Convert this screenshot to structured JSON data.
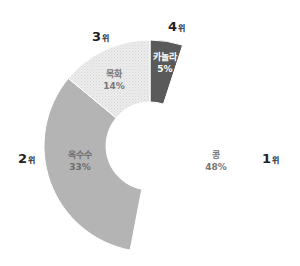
{
  "chart_data": {
    "type": "pie",
    "variant": "half-donut",
    "title": "",
    "center": [
      150,
      146
    ],
    "outer_radius": 106,
    "inner_radius": 44,
    "start_angle_deg": 0,
    "direction": "clockwise",
    "slices": [
      {
        "label": "카놀라",
        "value": 5,
        "display": "5%",
        "rank": "4",
        "color": "#5a5a5a",
        "text_color": "#ffffff",
        "label_pos": [
          165,
          63
        ],
        "rank_pos": [
          168,
          20
        ]
      },
      {
        "label": "콩",
        "value": 48,
        "display": "48%",
        "rank": "1",
        "color": "#ffffff",
        "text_color": "#777777",
        "label_pos": [
          216,
          161
        ],
        "rank_pos": [
          262,
          152
        ]
      },
      {
        "label": "옥수수",
        "value": 33,
        "display": "33%",
        "rank": "2",
        "color": "#b4b4b4",
        "text_color": "#6e6e6e",
        "label_pos": [
          80,
          161
        ],
        "rank_pos": [
          18,
          152
        ]
      },
      {
        "label": "목화",
        "value": 14,
        "display": "14%",
        "rank": "3",
        "color": "#e9e9e9",
        "pattern": "dots",
        "text_color": "#777777",
        "label_pos": [
          114,
          80
        ],
        "rank_pos": [
          92,
          30
        ]
      }
    ],
    "rank_suffix": "위",
    "legend": null
  }
}
